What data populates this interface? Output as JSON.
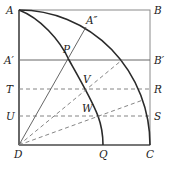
{
  "diagram": {
    "type": "quadratrix-construction",
    "colors": {
      "ink": "#2a2a2a",
      "thin": "#555555",
      "dashed": "#777777",
      "background": "#ffffff"
    },
    "points": {
      "A": {
        "label": "A",
        "x": 19,
        "y": 10
      },
      "B": {
        "label": "B",
        "x": 150,
        "y": 10
      },
      "C": {
        "label": "C",
        "x": 150,
        "y": 145
      },
      "D": {
        "label": "D",
        "x": 19,
        "y": 145
      },
      "A1": {
        "label": "A′",
        "x": 19,
        "y": 60
      },
      "B1": {
        "label": "B′",
        "x": 150,
        "y": 60
      },
      "T": {
        "label": "T",
        "x": 19,
        "y": 89
      },
      "R": {
        "label": "R",
        "x": 150,
        "y": 89
      },
      "U": {
        "label": "U",
        "x": 19,
        "y": 116
      },
      "S": {
        "label": "S",
        "x": 150,
        "y": 116
      },
      "P": {
        "label": "P",
        "x": 69,
        "y": 60
      },
      "A2": {
        "label": "A″",
        "x": 86,
        "y": 27
      },
      "V": {
        "label": "V",
        "x": 86,
        "y": 89
      },
      "W": {
        "label": "W",
        "x": 98,
        "y": 116
      },
      "Q": {
        "label": "Q",
        "x": 103,
        "y": 145
      }
    },
    "labels": {
      "A": "A",
      "B": "B",
      "C": "C",
      "D": "D",
      "A1": "A′",
      "B1": "B′",
      "T": "T",
      "R": "R",
      "U": "U",
      "S": "S",
      "P": "P",
      "A2": "A″",
      "V": "V",
      "W": "W",
      "Q": "Q"
    }
  }
}
